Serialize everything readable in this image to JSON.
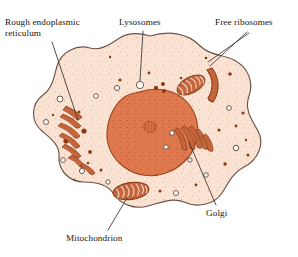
{
  "figure": {
    "background_color": "#ffffff"
  },
  "labels": [
    {
      "id": "rough-er",
      "text": "Rough endoplasmic\nreticulum",
      "x": 5,
      "y": 17
    },
    {
      "id": "lysosomes",
      "text": "Lysosomes",
      "x": 119,
      "y": 17
    },
    {
      "id": "free-ribosomes",
      "text": "Free ribosomes",
      "x": 215,
      "y": 17
    },
    {
      "id": "golgi",
      "text": "Golgi",
      "x": 206,
      "y": 208
    },
    {
      "id": "mitochondrion",
      "text": "Mitochondrion",
      "x": 66,
      "y": 233
    }
  ],
  "colors": {
    "outline": "#5a4a42",
    "membrane_stroke": "#6b5248",
    "cytoplasm_fill": "#fae3d3",
    "cytoplasm_stipple": "#c98b6b",
    "nucleus_fill": "#e07a4e",
    "nucleus_stroke": "#9c4420",
    "nucleus_stipple": "#8d3a18",
    "nucleolus_fill": "#d9713f",
    "organelle_fill": "#c4653c",
    "organelle_stroke": "#8f3c18",
    "vesicle_fill": "#ffffff",
    "vesicle_stroke": "#6b5248",
    "dark_granule": "#8b3a12",
    "leader_line": "#3a302a",
    "text": "#1a1410"
  },
  "structures": {
    "nucleus": {
      "name": "nucleus",
      "has_nucleolus": true
    },
    "nucleolus": {
      "name": "nucleolus"
    },
    "rough_er": {
      "name": "rough-endoplasmic-reticulum",
      "stack_count": 7
    },
    "golgi": {
      "name": "golgi-apparatus",
      "cisterna_count": 5
    },
    "mitochondria": {
      "name": "mitochondrion",
      "count": 3
    },
    "lysosomes": {
      "name": "lysosome",
      "count": 12
    },
    "free_ribosomes": {
      "name": "free-ribosome",
      "count": 9
    },
    "cell_membrane": {
      "name": "cell-membrane"
    }
  }
}
